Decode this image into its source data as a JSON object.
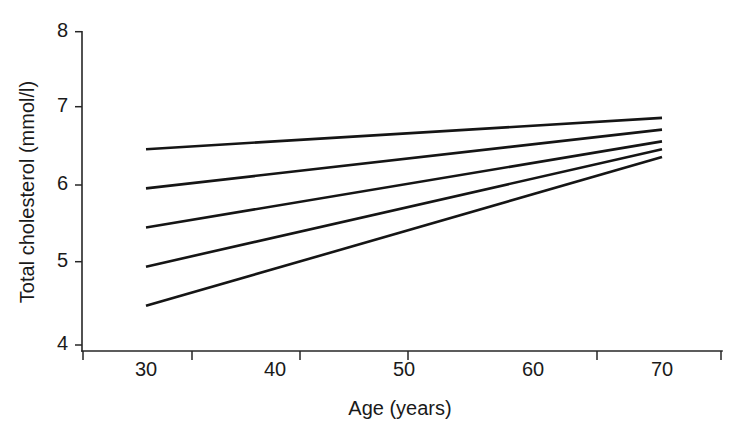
{
  "chart_data": {
    "type": "line",
    "title": "",
    "subtitle": "",
    "xlabel": "Age (years)",
    "ylabel": "Total cholesterol (mmol/l)",
    "xlim": [
      26.5,
      75.0
    ],
    "ylim": [
      4,
      8
    ],
    "xticks": [
      30,
      40,
      50,
      60,
      70
    ],
    "xtick_labels": [
      "30",
      "40",
      "50",
      "60",
      "70"
    ],
    "xtick_mark_positions": [
      27,
      35,
      45,
      55,
      65,
      75
    ],
    "yticks": [
      4,
      5,
      6,
      7,
      8
    ],
    "ytick_labels": [
      "4",
      "5",
      "6",
      "7",
      "8"
    ],
    "grid": false,
    "legend": false,
    "legend_position": "none",
    "x": [
      30,
      70
    ],
    "series": [
      {
        "name": "line-1",
        "values": [
          6.5,
          6.9
        ]
      },
      {
        "name": "line-2",
        "values": [
          6.0,
          6.75
        ]
      },
      {
        "name": "line-3",
        "values": [
          5.5,
          6.6
        ]
      },
      {
        "name": "line-4",
        "values": [
          5.0,
          6.5
        ]
      },
      {
        "name": "line-5",
        "values": [
          4.5,
          6.4
        ]
      }
    ],
    "line_color": "#151515",
    "axis_color": "#262626",
    "background_color": "#ffffff",
    "annotations": []
  }
}
